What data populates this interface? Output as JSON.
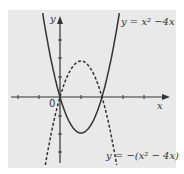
{
  "figure": {
    "background": "#e9e9e9",
    "ink": "#333333",
    "axes": {
      "x_label": "x",
      "y_label": "y",
      "origin_label": "0"
    },
    "curves": [
      {
        "name": "y = x^2 - 4x",
        "label": "y = x² −4x",
        "style": "solid"
      },
      {
        "name": "y = -(x^2 - 4x)",
        "label": "y = −(x² − 4x)",
        "style": "dashed"
      }
    ]
  },
  "chart_data": {
    "type": "line",
    "title": "",
    "xlabel": "x",
    "ylabel": "y",
    "xlim": [
      -5,
      8
    ],
    "ylim": [
      -7,
      8
    ],
    "grid": false,
    "series": [
      {
        "name": "y = x² − 4x",
        "style": "solid",
        "function": "x^2-4x",
        "vertex": [
          2,
          -4
        ],
        "roots": [
          0,
          4
        ]
      },
      {
        "name": "y = −(x² − 4x)",
        "style": "dashed",
        "function": "-(x^2-4x)",
        "vertex": [
          2,
          4
        ],
        "roots": [
          0,
          4
        ]
      }
    ]
  }
}
